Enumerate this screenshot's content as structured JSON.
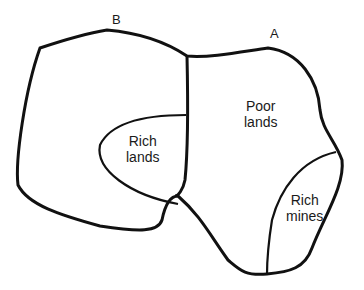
{
  "diagram": {
    "regions": {
      "country_b_label": "B",
      "country_a_label": "A",
      "poor_lands": {
        "line1": "Poor",
        "line2": "lands"
      },
      "rich_lands": {
        "line1": "Rich",
        "line2": "lands"
      },
      "rich_mines": {
        "line1": "Rich",
        "line2": "mines"
      }
    },
    "colors": {
      "stroke": "#111111",
      "background": "#ffffff",
      "text": "#1a1a1a"
    }
  }
}
